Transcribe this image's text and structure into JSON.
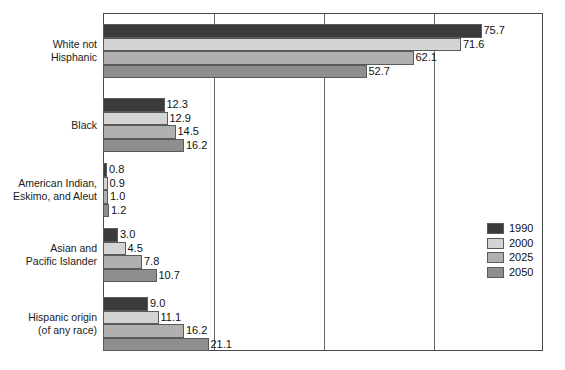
{
  "chart_data": {
    "type": "bar",
    "orientation": "horizontal",
    "title": "",
    "subtitle": "",
    "xlabel": "",
    "ylabel": "",
    "xlim": [
      0,
      88
    ],
    "grid": true,
    "gridlines_x": [
      0,
      22,
      44,
      66,
      88
    ],
    "legend_position": "right",
    "categories": [
      "White not\nHisphanic",
      "Black",
      "American Indian,\nEskimo, and Aleut",
      "Asian and\nPacific Islander",
      "Hispanic origin\n(of any race)"
    ],
    "series": [
      {
        "name": "1990",
        "color": "#3b3b3b",
        "values": [
          75.7,
          12.3,
          0.8,
          3.0,
          9.0
        ]
      },
      {
        "name": "2000",
        "color": "#d4d4d4",
        "values": [
          71.6,
          12.9,
          0.9,
          4.5,
          11.1
        ]
      },
      {
        "name": "2025",
        "color": "#b0b0b0",
        "values": [
          62.1,
          14.5,
          1.0,
          7.8,
          16.2
        ]
      },
      {
        "name": "2050",
        "color": "#8e8e8e",
        "values": [
          52.7,
          16.2,
          1.2,
          10.7,
          21.1
        ]
      }
    ],
    "value_labels": [
      [
        "75.7",
        "71.6",
        "62.1",
        "52.7"
      ],
      [
        "12.3",
        "12.9",
        "14.5",
        "16.2"
      ],
      [
        "0.8",
        "0.9",
        "1.0",
        "1.2"
      ],
      [
        "3.0",
        "4.5",
        "7.8",
        "10.7"
      ],
      [
        "9.0",
        "11.1",
        "16.2",
        "21.1"
      ]
    ]
  },
  "categories_display": [
    {
      "line1": "White not",
      "line2": "Hisphanic"
    },
    {
      "line1": "Black",
      "line2": ""
    },
    {
      "line1": "American Indian,",
      "line2": "Eskimo, and Aleut"
    },
    {
      "line1": "Asian and",
      "line2": "Pacific Islander"
    },
    {
      "line1": "Hispanic origin",
      "line2": "(of any race)"
    }
  ],
  "legend": {
    "items": [
      {
        "label": "1990",
        "color": "#3b3b3b"
      },
      {
        "label": "2000",
        "color": "#d4d4d4"
      },
      {
        "label": "2025",
        "color": "#b0b0b0"
      },
      {
        "label": "2050",
        "color": "#8e8e8e"
      }
    ]
  },
  "colors": {
    "frame": "#4a4a4a",
    "gridline": "#6a6a6a",
    "bar_border": "#5a5a5a",
    "text": "#111111",
    "background": "#ffffff"
  }
}
